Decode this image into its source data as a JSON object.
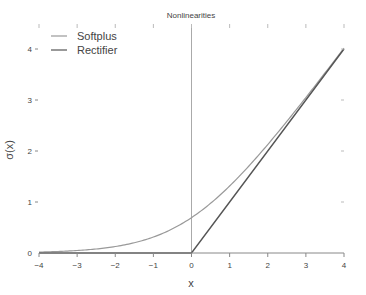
{
  "chart_data": {
    "type": "line",
    "title": "Nonlinearities",
    "xlabel": "x",
    "ylabel": "σ(x)",
    "xlim": [
      -4,
      4
    ],
    "ylim": [
      0,
      4
    ],
    "x_ticks": [
      "-4",
      "-3",
      "-2",
      "-1",
      "0",
      "1",
      "2",
      "3",
      "4"
    ],
    "y_ticks": [
      "0",
      "1",
      "2",
      "3",
      "4"
    ],
    "grid": false,
    "legend_position": "top-left",
    "series": [
      {
        "name": "Softplus",
        "function": "ln(1+e^x)",
        "color": "#999999",
        "x": [
          -4,
          -3,
          -2,
          -1,
          0,
          1,
          2,
          3,
          4
        ],
        "values": [
          0.018,
          0.049,
          0.127,
          0.313,
          0.693,
          1.313,
          2.127,
          3.049,
          4.018
        ]
      },
      {
        "name": "Rectifier",
        "function": "max(0,x)",
        "color": "#555555",
        "x": [
          -4,
          -3,
          -2,
          -1,
          0,
          1,
          2,
          3,
          4
        ],
        "values": [
          0,
          0,
          0,
          0,
          0,
          1,
          2,
          3,
          4
        ]
      }
    ],
    "annotations": [
      {
        "type": "vertical-line",
        "x": 0
      }
    ]
  }
}
